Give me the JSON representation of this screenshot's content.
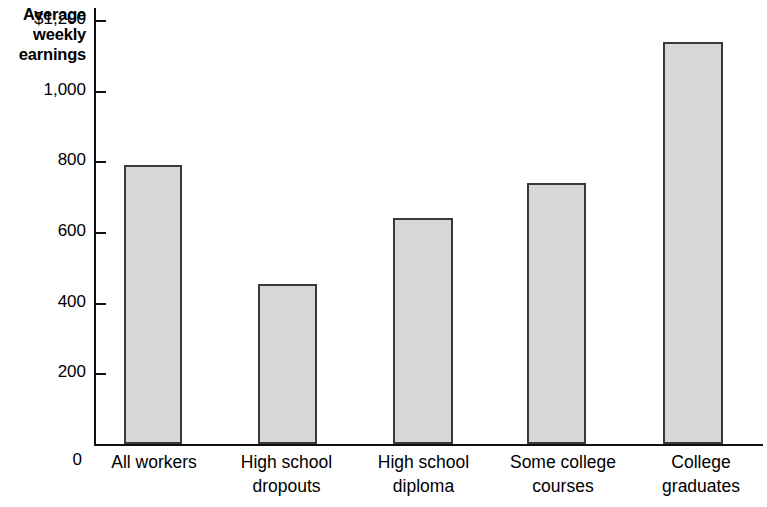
{
  "chart_data": {
    "type": "bar",
    "title": "",
    "subtitle": "",
    "ylabel": "Average weekly earnings",
    "ylabel_lines": [
      "Average",
      "weekly",
      "earnings"
    ],
    "xlabel": "",
    "categories": [
      "All workers",
      "High school dropouts",
      "High school diploma",
      "Some college courses",
      "College graduates"
    ],
    "category_lines": [
      [
        "All workers"
      ],
      [
        "High school",
        "dropouts"
      ],
      [
        "High school",
        "diploma"
      ],
      [
        "Some college",
        "courses"
      ],
      [
        "College",
        "graduates"
      ]
    ],
    "values": [
      790,
      455,
      640,
      740,
      1140
    ],
    "ylim": [
      0,
      1240
    ],
    "yticks": [
      200,
      400,
      600,
      800,
      1000,
      1200
    ],
    "ytick_labels": [
      "200",
      "400",
      "600",
      "800",
      "1,000",
      "$1,200"
    ],
    "zero_label": "0",
    "grid": false,
    "legend": null,
    "bar_fill_color": "#d7d7d7",
    "bar_border_color": "#3a3a3a",
    "axis_color": "#111111"
  }
}
